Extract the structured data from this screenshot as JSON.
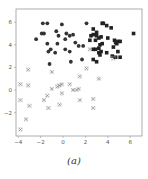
{
  "caption": "(a)",
  "chart_data": {
    "type": "scatter",
    "title": "",
    "xlabel": "",
    "ylabel": "",
    "xlim": [
      -4.2,
      7.0
    ],
    "ylim": [
      -4.0,
      7.0
    ],
    "xticks": [
      -4,
      -2,
      0,
      2,
      4,
      6
    ],
    "yticks": [
      -2,
      0,
      2,
      4,
      6
    ],
    "grid": false,
    "legend": null,
    "series": [
      {
        "name": "class-1",
        "marker": "circle",
        "color": "#333333",
        "points": [
          [
            -1.8,
            5.9
          ],
          [
            -1.4,
            5.9
          ],
          [
            -0.1,
            5.8
          ],
          [
            -1.9,
            5.0
          ],
          [
            -1.7,
            5.0
          ],
          [
            -2.4,
            4.5
          ],
          [
            -0.6,
            5.2
          ],
          [
            -0.4,
            4.8
          ],
          [
            0.3,
            5.0
          ],
          [
            0.6,
            4.8
          ],
          [
            0.9,
            4.9
          ],
          [
            0.2,
            4.5
          ],
          [
            -1.4,
            4.1
          ],
          [
            -0.5,
            4.1
          ],
          [
            -1.1,
            3.6
          ],
          [
            -1.3,
            3.4
          ],
          [
            -0.7,
            3.3
          ],
          [
            0.2,
            3.6
          ],
          [
            0.6,
            3.4
          ],
          [
            1.1,
            4.2
          ],
          [
            1.4,
            3.9
          ],
          [
            1.8,
            3.9
          ],
          [
            0.7,
            2.5
          ],
          [
            -1.2,
            2.3
          ],
          [
            1.7,
            2.7
          ],
          [
            2.1,
            5.9
          ]
        ]
      },
      {
        "name": "class-2",
        "marker": "square",
        "color": "#222222",
        "points": [
          [
            3.5,
            5.9
          ],
          [
            3.6,
            5.9
          ],
          [
            3.9,
            5.7
          ],
          [
            2.7,
            5.4
          ],
          [
            3.0,
            5.1
          ],
          [
            4.3,
            5.5
          ],
          [
            2.5,
            4.8
          ],
          [
            2.7,
            4.9
          ],
          [
            3.0,
            4.8
          ],
          [
            3.2,
            4.6
          ],
          [
            3.4,
            4.7
          ],
          [
            2.9,
            4.4
          ],
          [
            2.4,
            4.4
          ],
          [
            4.0,
            4.6
          ],
          [
            4.6,
            4.4
          ],
          [
            4.8,
            4.1
          ],
          [
            4.9,
            4.3
          ],
          [
            5.1,
            4.3
          ],
          [
            4.7,
            4.2
          ],
          [
            3.3,
            4.0
          ],
          [
            3.5,
            4.1
          ],
          [
            3.2,
            3.7
          ],
          [
            2.7,
            3.6
          ],
          [
            2.9,
            3.6
          ],
          [
            3.4,
            3.4
          ],
          [
            3.2,
            3.3
          ],
          [
            3.3,
            3.1
          ],
          [
            3.9,
            3.3
          ],
          [
            4.5,
            3.8
          ],
          [
            4.9,
            3.4
          ],
          [
            4.4,
            3.0
          ],
          [
            4.7,
            2.9
          ],
          [
            5.1,
            2.9
          ],
          [
            2.7,
            2.7
          ],
          [
            3.0,
            2.5
          ],
          [
            6.3,
            5.0
          ]
        ]
      },
      {
        "name": "class-3",
        "marker": "x",
        "color": "#666666",
        "points": [
          [
            -3.8,
            0.5
          ],
          [
            -3.1,
            1.8
          ],
          [
            -3.1,
            0.4
          ],
          [
            -3.8,
            -0.9
          ],
          [
            -3.0,
            -1.4
          ],
          [
            -3.3,
            -2.6
          ],
          [
            -3.8,
            -3.5
          ],
          [
            -1.0,
            1.6
          ],
          [
            -1.4,
            -0.5
          ],
          [
            -1.7,
            -0.9
          ],
          [
            -1.3,
            -1.6
          ],
          [
            -1.0,
            0.1
          ],
          [
            -0.5,
            0.3
          ],
          [
            -0.3,
            0.4
          ],
          [
            -0.1,
            0.5
          ],
          [
            -0.1,
            -0.3
          ],
          [
            -0.3,
            -1.3
          ],
          [
            0.6,
            0.5
          ],
          [
            0.9,
            0.0
          ],
          [
            1.2,
            0.0
          ],
          [
            1.4,
            0.1
          ],
          [
            1.5,
            1.2
          ],
          [
            1.5,
            -0.9
          ],
          [
            2.1,
            1.9
          ],
          [
            2.4,
            3.6
          ],
          [
            2.7,
            -0.8
          ],
          [
            2.7,
            -1.6
          ],
          [
            3.2,
            1.0
          ],
          [
            4.5,
            2.8
          ]
        ]
      }
    ]
  }
}
